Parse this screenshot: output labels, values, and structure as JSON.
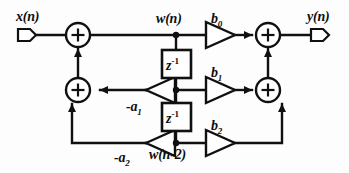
{
  "diagram": {
    "type": "block-diagram",
    "stroke_color": "#101010",
    "background_color": "#fdfdfd"
  },
  "terminals": {
    "input_label": "x(n)",
    "output_label": "y(n)"
  },
  "nodes": {
    "w_n_label": "w(n)",
    "w_n2_label": "w(n-2)"
  },
  "delays": [
    {
      "label_base": "z",
      "label_exp": "-1"
    },
    {
      "label_base": "z",
      "label_exp": "-1"
    }
  ],
  "feedforward_gains": [
    {
      "base": "b",
      "sub": "0"
    },
    {
      "base": "b",
      "sub": "1"
    },
    {
      "base": "b",
      "sub": "2"
    }
  ],
  "feedback_gains": [
    {
      "base": "-a",
      "sub": "1"
    },
    {
      "base": "-a",
      "sub": "2"
    }
  ],
  "adders": {
    "symbol": "+",
    "count": 4
  }
}
